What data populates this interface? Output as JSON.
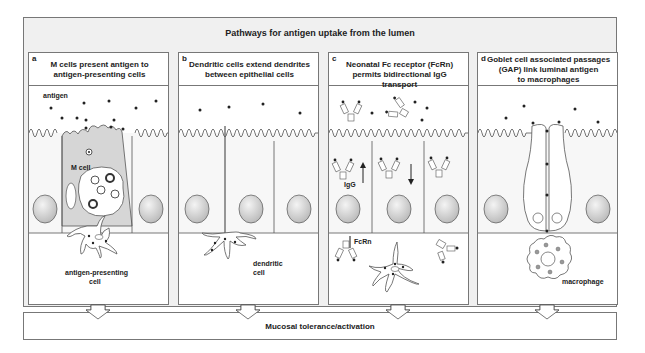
{
  "header": {
    "title": "Pathways for antigen uptake from the lumen"
  },
  "panels": [
    {
      "letter": "a",
      "title_line1": "M cells present antigen to",
      "title_line2": "antigen-presenting cells",
      "labels": {
        "antigen": "antigen",
        "m_cell": "M cell",
        "apc_line1": "antigen-presenting",
        "apc_line2": "cell"
      }
    },
    {
      "letter": "b",
      "title_line1": "Dendritic cells extend dendrites",
      "title_line2": "between epithelial cells",
      "labels": {
        "dc_line1": "dendritic",
        "dc_line2": "cell"
      }
    },
    {
      "letter": "c",
      "title_line1": "Neonatal Fc receptor (FcRn)",
      "title_line2": "permits bidirectional IgG transport",
      "labels": {
        "igg": "IgG",
        "fcrn": "FcRn"
      }
    },
    {
      "letter": "d",
      "title_line1": "Goblet cell associated passages",
      "title_line2": "(GAP) link luminal antigen",
      "title_line3": "to macrophages",
      "labels": {
        "macrophage": "macrophage"
      }
    }
  ],
  "footer": {
    "title": "Mucosal tolerance/activation"
  },
  "colors": {
    "stroke": "#555555",
    "m_cell_fill": "#d6d6d6",
    "nucleus": "#d9d9d9",
    "header_bg": "#f0f0f0"
  }
}
